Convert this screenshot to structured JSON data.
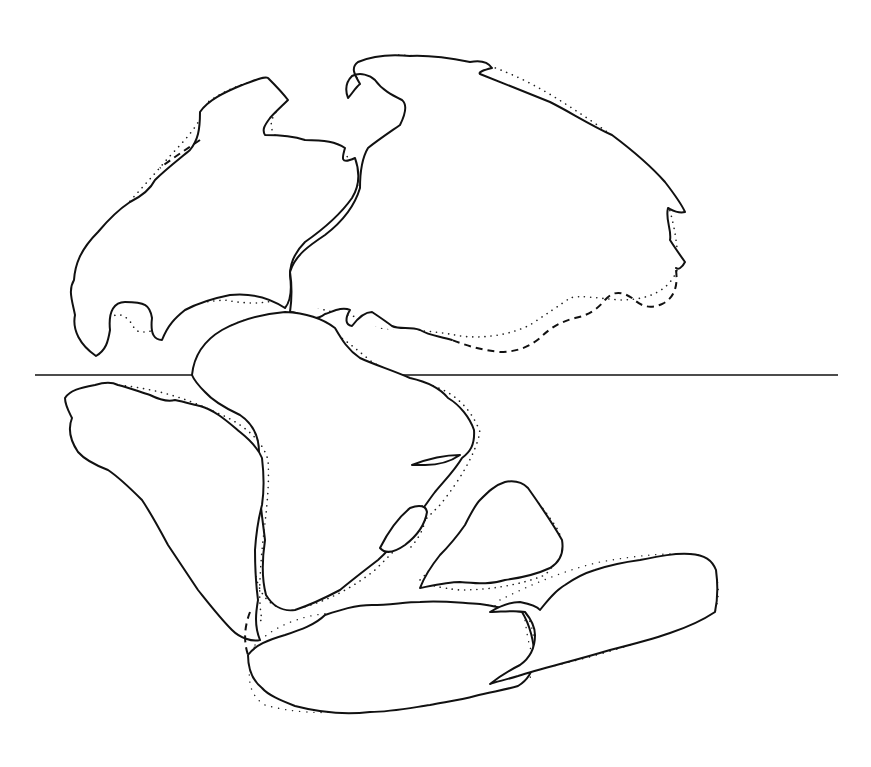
{
  "figure": {
    "type": "paleogeographic reconstruction map",
    "style": "line drawing with stippled continental shelf margins",
    "colors": {
      "line": "#111111",
      "stipple": "#222222",
      "background": "#ffffff"
    }
  },
  "elements": {
    "equator_line": {
      "y": 375,
      "x_start": 35,
      "x_end": 838
    },
    "landmasses": [
      {
        "name": "north-america"
      },
      {
        "name": "eurasia"
      },
      {
        "name": "africa"
      },
      {
        "name": "south-america"
      },
      {
        "name": "india"
      },
      {
        "name": "madagascar"
      },
      {
        "name": "antarctica"
      },
      {
        "name": "australia"
      }
    ]
  }
}
